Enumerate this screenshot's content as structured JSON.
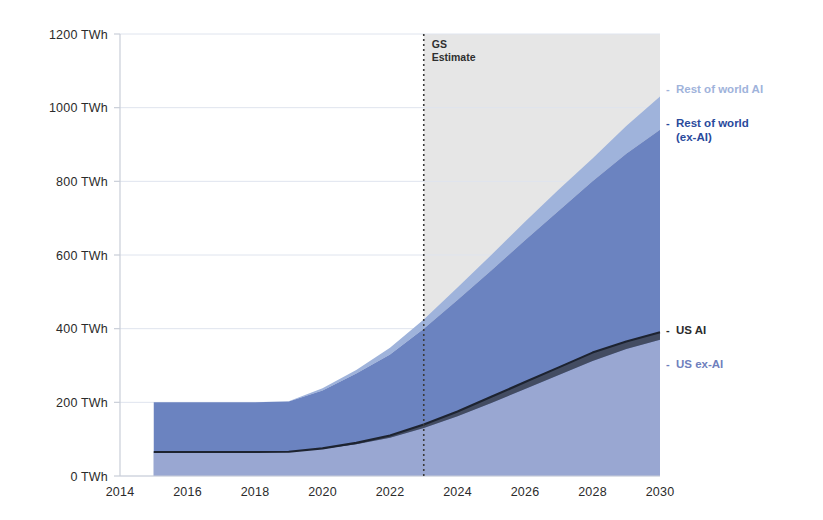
{
  "chart_data": {
    "type": "area",
    "title": "",
    "subtitle": "",
    "xlabel": "",
    "ylabel": "",
    "stacked": true,
    "grid": true,
    "legend_position": "right-inline",
    "x": [
      2015,
      2016,
      2017,
      2018,
      2019,
      2020,
      2021,
      2022,
      2023,
      2024,
      2025,
      2026,
      2027,
      2028,
      2029,
      2030
    ],
    "xlim": [
      2014,
      2030
    ],
    "ylim": [
      0,
      1200
    ],
    "xticks": [
      2014,
      2016,
      2018,
      2020,
      2022,
      2024,
      2026,
      2028,
      2030
    ],
    "xtick_labels": [
      "2014",
      "2016",
      "2018",
      "2020",
      "2022",
      "2024",
      "2026",
      "2028",
      "2030"
    ],
    "yticks": [
      0,
      200,
      400,
      600,
      800,
      1000,
      1200
    ],
    "ytick_labels": [
      "0 TWh",
      "200 TWh",
      "400 TWh",
      "600 TWh",
      "800 TWh",
      "1000 TWh",
      "1200 TWh"
    ],
    "y_unit": "TWh",
    "series": [
      {
        "name": "US AI",
        "color": "#3a3f4d",
        "label_color": "#2b2b2b",
        "kind": "line-boundary",
        "values": [
          65,
          65,
          65,
          65,
          66,
          75,
          90,
          110,
          140,
          175,
          215,
          255,
          295,
          335,
          365,
          390
        ]
      },
      {
        "name": "US ex-AI",
        "color": "#9daad4",
        "label_color": "#6f7fbd",
        "kind": "band-top",
        "values": [
          65,
          65,
          65,
          65,
          66,
          74,
          86,
          104,
          130,
          162,
          198,
          236,
          274,
          312,
          345,
          370
        ]
      },
      {
        "name": "Rest of world (ex-AI)",
        "color": "#6b83c0",
        "label_color": "#2a4a9c",
        "kind": "band-top",
        "values": [
          200,
          200,
          200,
          200,
          202,
          232,
          278,
          330,
          400,
          478,
          558,
          640,
          720,
          800,
          875,
          940
        ]
      },
      {
        "name": "Rest of world AI",
        "color": "#9fb3db",
        "label_color": "#9fb3db",
        "kind": "band-top",
        "values": [
          200,
          200,
          200,
          200,
          203,
          238,
          288,
          348,
          425,
          512,
          600,
          690,
          778,
          862,
          950,
          1030
        ]
      }
    ],
    "annotations": [
      {
        "name": "gs-estimate",
        "line1": "GS",
        "line2": "Estimate",
        "x": 2023,
        "style": "dotted-vertical",
        "color": "#3a3a3a"
      }
    ],
    "forecast_region": {
      "from": 2023,
      "to": 2030,
      "shade_color": "#e6e6e6"
    },
    "legend_entries": [
      {
        "label": "Rest of world AI",
        "color": "#9fb3db",
        "dash": "-"
      },
      {
        "label": "Rest of world",
        "label2": "(ex-AI)",
        "color": "#2a4a9c",
        "dash": "-"
      },
      {
        "label": "US AI",
        "color": "#2b2b2b",
        "dash": "-"
      },
      {
        "label": "US ex-AI",
        "color": "#6f7fbd",
        "dash": "-"
      }
    ]
  },
  "legend": {
    "rest_of_world_ai": "Rest of world AI",
    "rest_of_world_exai_line1": "Rest of world",
    "rest_of_world_exai_line2": "(ex-AI)",
    "us_ai": "US AI",
    "us_exai": "US ex-AI",
    "dash": "-"
  },
  "annotation": {
    "gs_line1": "GS",
    "gs_line2": "Estimate"
  },
  "axis": {
    "y0": "0 TWh",
    "y200": "200 TWh",
    "y400": "400 TWh",
    "y600": "600 TWh",
    "y800": "800 TWh",
    "y1000": "1000 TWh",
    "y1200": "1200 TWh",
    "x2014": "2014",
    "x2016": "2016",
    "x2018": "2018",
    "x2020": "2020",
    "x2022": "2022",
    "x2024": "2024",
    "x2026": "2026",
    "x2028": "2028",
    "x2030": "2030"
  },
  "colors": {
    "rest_of_world_ai": "#9fb3db",
    "rest_of_world_exai": "#6b83c0",
    "us_exai": "#9daad4",
    "us_ai": "#3a3f4d",
    "forecast_shade": "#e6e6e6",
    "grid": "#dfe4ee",
    "axis": "#c9ced8"
  }
}
